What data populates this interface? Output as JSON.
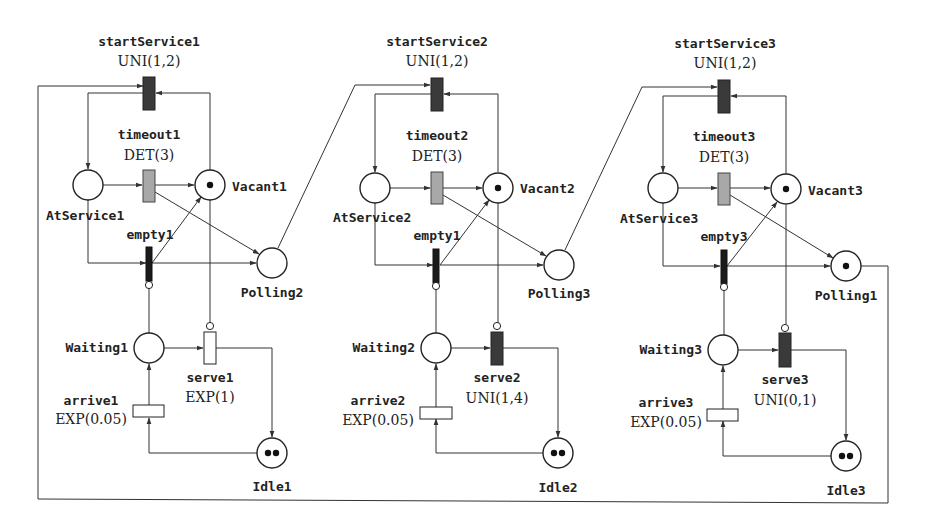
{
  "diagram": {
    "type": "stochastic-petri-net",
    "colors": {
      "timed_transition_dark": "#3a3a3a",
      "deterministic_transition": "#a8a8a8",
      "immediate_transition": "#1a1a1a",
      "exp_transition": "#ffffff",
      "line": "#333333"
    },
    "stations": [
      {
        "id": 1,
        "startService": {
          "name": "startService1",
          "dist": "UNI(1,2)"
        },
        "timeout": {
          "name": "timeout1",
          "dist": "DET(3)"
        },
        "empty": {
          "name": "empty1"
        },
        "serve": {
          "name": "serve1",
          "dist": "EXP(1)"
        },
        "arrive": {
          "name": "arrive1",
          "dist": "EXP(0.05)"
        },
        "places": {
          "atService": {
            "name": "AtService1",
            "tokens": 0
          },
          "vacant": {
            "name": "Vacant1",
            "tokens": 1
          },
          "polling": {
            "name": "Polling2",
            "tokens": 0
          },
          "waiting": {
            "name": "Waiting1",
            "tokens": 0
          },
          "idle": {
            "name": "Idle1",
            "tokens": 2
          }
        }
      },
      {
        "id": 2,
        "startService": {
          "name": "startService2",
          "dist": "UNI(1,2)"
        },
        "timeout": {
          "name": "timeout2",
          "dist": "DET(3)"
        },
        "empty": {
          "name": "empty1"
        },
        "serve": {
          "name": "serve2",
          "dist": "UNI(1,4)"
        },
        "arrive": {
          "name": "arrive2",
          "dist": "EXP(0.05)"
        },
        "places": {
          "atService": {
            "name": "AtService2",
            "tokens": 0
          },
          "vacant": {
            "name": "Vacant2",
            "tokens": 1
          },
          "polling": {
            "name": "Polling3",
            "tokens": 0
          },
          "waiting": {
            "name": "Waiting2",
            "tokens": 0
          },
          "idle": {
            "name": "Idle2",
            "tokens": 2
          }
        }
      },
      {
        "id": 3,
        "startService": {
          "name": "startService3",
          "dist": "UNI(1,2)"
        },
        "timeout": {
          "name": "timeout3",
          "dist": "DET(3)"
        },
        "empty": {
          "name": "empty3"
        },
        "serve": {
          "name": "serve3",
          "dist": "UNI(0,1)"
        },
        "arrive": {
          "name": "arrive3",
          "dist": "EXP(0.05)"
        },
        "places": {
          "atService": {
            "name": "AtService3",
            "tokens": 0
          },
          "vacant": {
            "name": "Vacant3",
            "tokens": 1
          },
          "polling": {
            "name": "Polling1",
            "tokens": 1
          },
          "waiting": {
            "name": "Waiting3",
            "tokens": 0
          },
          "idle": {
            "name": "Idle3",
            "tokens": 2
          }
        }
      }
    ]
  }
}
